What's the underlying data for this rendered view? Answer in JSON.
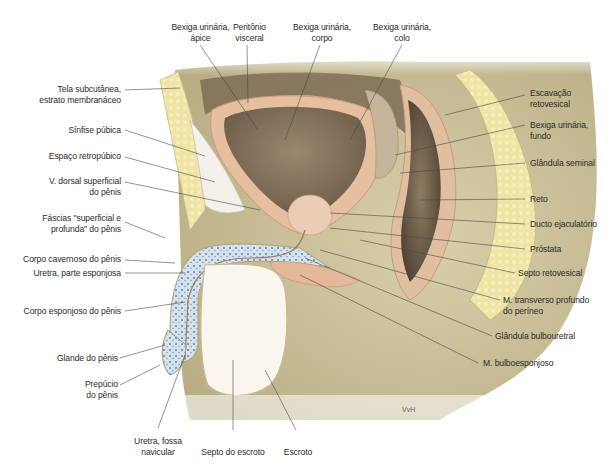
{
  "caption": "Bexiga urinária e uretra masculina, corte mediano",
  "signature": "VvH",
  "labels": {
    "bexiga_apice": [
      "Bexiga urinária,",
      "ápice"
    ],
    "peritonio": [
      "Peritônio",
      "visceral"
    ],
    "bexiga_corpo": [
      "Bexiga urinária,",
      "corpo"
    ],
    "bexiga_colo": [
      "Bexiga urinária,",
      "colo"
    ],
    "tela_subcutanea": [
      "Tela subcutânea,",
      "estrato membranáceo"
    ],
    "sinfise": [
      "Sínfise púbica"
    ],
    "espaco_retropubico": [
      "Espaço retropúbico"
    ],
    "v_dorsal": [
      "V. dorsal superficial",
      "do pênis"
    ],
    "fascias": [
      "Fáscias \"superficial e",
      "profunda\" do pênis"
    ],
    "corpo_cavernoso": [
      "Corpo cavernoso do pênis"
    ],
    "uretra_esponjosa": [
      "Uretra, parte esponjosa"
    ],
    "corpo_esponjoso": [
      "Corpo esponjoso do pênis"
    ],
    "glande": [
      "Glande do pênis"
    ],
    "prepucio": [
      "Prepúcio",
      "do pênis"
    ],
    "uretra_fossa": [
      "Uretra, fossa",
      "navicular"
    ],
    "septo_escroto": [
      "Septo do escroto"
    ],
    "escroto": [
      "Escroto"
    ],
    "escavacao": [
      "Escavação",
      "retovesical"
    ],
    "bexiga_fundo": [
      "Bexiga urinária,",
      "fundo"
    ],
    "glandula_seminal": [
      "Glândula seminal"
    ],
    "reto": [
      "Reto"
    ],
    "ducto_ejaculatorio": [
      "Ducto ejaculatório"
    ],
    "prostata": [
      "Próstata"
    ],
    "septo_retovesical": [
      "Septo retovesical"
    ],
    "m_transverso": [
      "M. transverso profundo",
      "do períneo"
    ],
    "glandula_bulbouretral": [
      "Glândula bulbouretral"
    ],
    "m_bulboesponjoso": [
      "M. bulboesponjoso"
    ]
  },
  "colors": {
    "skin": "#d8cfa8",
    "skin_dark": "#b8ad86",
    "fat": "#efe3a0",
    "muscle": "#e8c4a6",
    "bladder_lumen": "#8a7760",
    "cavity": "#6e5e4a",
    "spongy": "#c9d8e6",
    "scrotum": "#f7f5ee",
    "leader": "#444444"
  }
}
